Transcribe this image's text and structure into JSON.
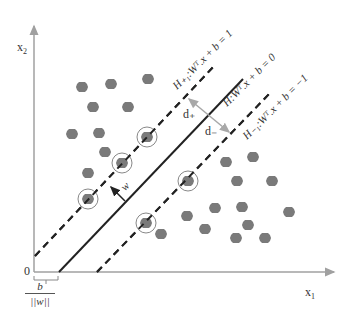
{
  "diagram": {
    "axes": {
      "x_label": "x",
      "x_sub": "1",
      "y_label": "x",
      "y_sub": "2",
      "origin_label": "0",
      "axis_color": "#a0a0a0"
    },
    "hyperplanes": {
      "upper": {
        "label": "H+1: W^T . x + b = 1",
        "style": "dashed"
      },
      "middle": {
        "label": "H: W^T . x + b = 0",
        "style": "solid"
      },
      "lower": {
        "label": "H-1: W^T . x + b = -1",
        "style": "dashed"
      }
    },
    "labels": {
      "upper_eq": "H₊₁:Wᵀ.x + b = 1",
      "middle_eq": "H:Wᵀ.x + b = 0",
      "lower_eq": "H₋₁:Wᵀ.x + b = −1",
      "d_plus": "d₊",
      "d_minus": "d₋",
      "w": "w",
      "offset_num": "b",
      "offset_den": "||w||"
    },
    "colors": {
      "point": "#7a7a7a",
      "line": "#222222",
      "margin_arrow": "#a8a8a8",
      "support_circle": "#888888"
    },
    "class_positive_points": [
      [
        82,
        87
      ],
      [
        111,
        84
      ],
      [
        148,
        79
      ],
      [
        93,
        107
      ],
      [
        128,
        107
      ],
      [
        72,
        134
      ],
      [
        99,
        133
      ],
      [
        105,
        152
      ],
      [
        88,
        173
      ]
    ],
    "class_negative_points": [
      [
        226,
        162
      ],
      [
        253,
        157
      ],
      [
        237,
        181
      ],
      [
        272,
        181
      ],
      [
        215,
        208
      ],
      [
        242,
        207
      ],
      [
        187,
        216
      ],
      [
        289,
        212
      ],
      [
        205,
        229
      ],
      [
        248,
        225
      ],
      [
        161,
        234
      ],
      [
        236,
        238
      ],
      [
        265,
        238
      ]
    ],
    "support_vectors_positive": [
      [
        147,
        137
      ],
      [
        122,
        163
      ],
      [
        88,
        199
      ]
    ],
    "support_vectors_negative": [
      [
        188,
        181
      ],
      [
        146,
        223
      ]
    ]
  }
}
